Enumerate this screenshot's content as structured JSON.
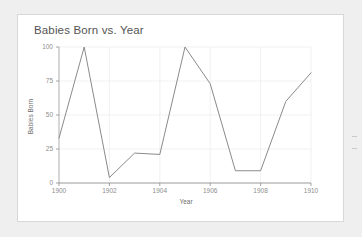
{
  "card": {
    "title": "Babies Born vs. Year",
    "background": "#ffffff",
    "border_color": "#d8d8d8"
  },
  "page": {
    "background": "#efefef"
  },
  "chart_data": {
    "type": "line",
    "title": "Babies Born vs. Year",
    "xlabel": "Year",
    "ylabel": "Babies Born",
    "x": [
      1900,
      1901,
      1902,
      1903,
      1904,
      1905,
      1906,
      1907,
      1908,
      1909,
      1910
    ],
    "values": [
      33,
      100,
      4,
      22,
      21,
      100,
      73,
      9,
      9,
      60,
      81
    ],
    "series": [
      {
        "name": "Babies Born",
        "values": [
          33,
          100,
          4,
          22,
          21,
          100,
          73,
          9,
          9,
          60,
          81
        ],
        "color": "#8a8a8a"
      }
    ],
    "xlim": [
      1900,
      1910
    ],
    "ylim": [
      0,
      100
    ],
    "xticks": [
      1900,
      1902,
      1904,
      1906,
      1908,
      1910
    ],
    "xtick_labels": [
      "1900",
      "1902",
      "1904",
      "1906",
      "1908",
      "1910"
    ],
    "yticks": [
      0,
      25,
      50,
      75,
      100
    ],
    "ytick_labels": [
      "0",
      "25",
      "50",
      "75",
      "100"
    ],
    "grid": true,
    "grid_color": "#ededed",
    "axis_color": "#8d8d8d",
    "legend": false,
    "legend_position": "none"
  }
}
